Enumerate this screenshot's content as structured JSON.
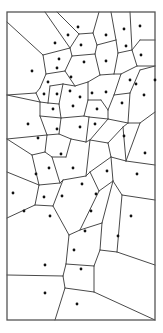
{
  "diagram": {
    "type": "voronoi",
    "width": 163,
    "height": 333,
    "colors": {
      "background": "#ffffff",
      "edge": "#4a4a4a",
      "border": "#555555",
      "site": "#111111"
    },
    "border": {
      "x1": 7,
      "y1": 12,
      "x2": 155,
      "y2": 320
    },
    "sites": [
      [
        78,
        27
      ],
      [
        68,
        35
      ],
      [
        55,
        43
      ],
      [
        81,
        45
      ],
      [
        106,
        35
      ],
      [
        124,
        29
      ],
      [
        140,
        26
      ],
      [
        126,
        46
      ],
      [
        141,
        55
      ],
      [
        59,
        59
      ],
      [
        84,
        62
      ],
      [
        106,
        61
      ],
      [
        32,
        71
      ],
      [
        57,
        68
      ],
      [
        71,
        77
      ],
      [
        48,
        82
      ],
      [
        130,
        80
      ],
      [
        155,
        80
      ],
      [
        44,
        94
      ],
      [
        57,
        94
      ],
      [
        70,
        91
      ],
      [
        80,
        97
      ],
      [
        92,
        93
      ],
      [
        106,
        92
      ],
      [
        136,
        84
      ],
      [
        53,
        109
      ],
      [
        73,
        106
      ],
      [
        97,
        109
      ],
      [
        122,
        103
      ],
      [
        144,
        95
      ],
      [
        28,
        124
      ],
      [
        38,
        138
      ],
      [
        57,
        129
      ],
      [
        80,
        127
      ],
      [
        95,
        124
      ],
      [
        124,
        136
      ],
      [
        145,
        153
      ],
      [
        61,
        154
      ],
      [
        107,
        171
      ],
      [
        137,
        174
      ],
      [
        36,
        174
      ],
      [
        49,
        168
      ],
      [
        73,
        168
      ],
      [
        13,
        193
      ],
      [
        44,
        197
      ],
      [
        62,
        196
      ],
      [
        82,
        184
      ],
      [
        96,
        194
      ],
      [
        24,
        211
      ],
      [
        50,
        216
      ],
      [
        91,
        211
      ],
      [
        131,
        216
      ],
      [
        85,
        231
      ],
      [
        118,
        236
      ],
      [
        74,
        250
      ],
      [
        45,
        265
      ],
      [
        81,
        269
      ],
      [
        45,
        293
      ],
      [
        77,
        304
      ]
    ],
    "edges": [
      [
        7,
        22,
        43,
        55
      ],
      [
        45,
        12,
        70,
        48
      ],
      [
        57,
        12,
        79,
        34
      ],
      [
        43,
        55,
        70,
        48
      ],
      [
        70,
        48,
        79,
        34
      ],
      [
        79,
        34,
        93,
        33
      ],
      [
        93,
        33,
        99,
        12
      ],
      [
        93,
        33,
        97,
        45
      ],
      [
        97,
        45,
        116,
        40
      ],
      [
        116,
        40,
        111,
        12
      ],
      [
        116,
        40,
        118,
        53
      ],
      [
        118,
        53,
        132,
        50
      ],
      [
        132,
        50,
        130,
        12
      ],
      [
        132,
        50,
        140,
        40
      ],
      [
        140,
        40,
        155,
        40
      ],
      [
        70,
        48,
        72,
        56
      ],
      [
        72,
        56,
        95,
        54
      ],
      [
        95,
        54,
        97,
        45
      ],
      [
        95,
        54,
        100,
        75
      ],
      [
        118,
        53,
        114,
        74
      ],
      [
        114,
        74,
        100,
        75
      ],
      [
        43,
        55,
        46,
        74
      ],
      [
        46,
        74,
        65,
        71
      ],
      [
        65,
        71,
        72,
        56
      ],
      [
        132,
        50,
        137,
        66
      ],
      [
        137,
        66,
        155,
        66
      ],
      [
        137,
        66,
        121,
        74
      ],
      [
        121,
        74,
        114,
        74
      ],
      [
        65,
        71,
        75,
        86
      ],
      [
        75,
        86,
        88,
        82
      ],
      [
        88,
        82,
        100,
        75
      ],
      [
        46,
        74,
        40,
        88
      ],
      [
        40,
        88,
        36,
        93
      ],
      [
        7,
        95,
        36,
        93
      ],
      [
        7,
        95,
        40,
        102
      ],
      [
        36,
        93,
        40,
        102
      ],
      [
        40,
        102,
        48,
        103
      ],
      [
        48,
        103,
        50,
        86
      ],
      [
        50,
        86,
        63,
        84
      ],
      [
        63,
        84,
        75,
        86
      ],
      [
        48,
        103,
        59,
        104
      ],
      [
        59,
        104,
        63,
        84
      ],
      [
        59,
        104,
        61,
        118
      ],
      [
        40,
        102,
        40,
        116
      ],
      [
        40,
        116,
        61,
        118
      ],
      [
        61,
        118,
        84,
        116
      ],
      [
        84,
        116,
        88,
        100
      ],
      [
        88,
        100,
        88,
        82
      ],
      [
        88,
        100,
        101,
        100
      ],
      [
        101,
        100,
        108,
        110
      ],
      [
        108,
        110,
        114,
        95
      ],
      [
        114,
        95,
        121,
        74
      ],
      [
        114,
        95,
        130,
        93
      ],
      [
        130,
        93,
        140,
        70
      ],
      [
        140,
        70,
        155,
        66
      ],
      [
        130,
        93,
        128,
        123
      ],
      [
        128,
        123,
        108,
        119
      ],
      [
        108,
        119,
        108,
        110
      ],
      [
        128,
        123,
        140,
        123
      ],
      [
        140,
        123,
        155,
        112
      ],
      [
        84,
        116,
        89,
        117
      ],
      [
        89,
        117,
        108,
        119
      ],
      [
        108,
        119,
        90,
        140
      ],
      [
        89,
        117,
        86,
        142
      ],
      [
        86,
        142,
        90,
        140
      ],
      [
        61,
        118,
        59,
        134
      ],
      [
        40,
        116,
        47,
        135
      ],
      [
        47,
        135,
        59,
        134
      ],
      [
        7,
        139,
        47,
        135
      ],
      [
        47,
        135,
        45,
        152
      ],
      [
        45,
        152,
        52,
        157
      ],
      [
        52,
        157,
        66,
        157
      ],
      [
        66,
        157,
        71,
        139
      ],
      [
        71,
        139,
        86,
        142
      ],
      [
        59,
        134,
        71,
        139
      ],
      [
        7,
        139,
        32,
        155
      ],
      [
        32,
        155,
        45,
        152
      ],
      [
        32,
        155,
        39,
        185
      ],
      [
        39,
        185,
        60,
        183
      ],
      [
        60,
        183,
        52,
        157
      ],
      [
        60,
        183,
        63,
        180
      ],
      [
        63,
        180,
        86,
        176
      ],
      [
        86,
        176,
        90,
        140
      ],
      [
        90,
        140,
        108,
        143
      ],
      [
        108,
        143,
        123,
        127
      ],
      [
        123,
        127,
        128,
        123
      ],
      [
        108,
        143,
        111,
        157
      ],
      [
        111,
        157,
        126,
        161
      ],
      [
        126,
        161,
        123,
        127
      ],
      [
        126,
        161,
        140,
        123
      ],
      [
        126,
        161,
        155,
        165
      ],
      [
        111,
        157,
        90,
        172
      ],
      [
        90,
        172,
        86,
        176
      ],
      [
        90,
        172,
        99,
        191
      ],
      [
        99,
        191,
        113,
        181
      ],
      [
        113,
        181,
        111,
        157
      ],
      [
        113,
        181,
        122,
        195
      ],
      [
        122,
        195,
        155,
        200
      ],
      [
        7,
        172,
        39,
        185
      ],
      [
        39,
        185,
        35,
        205
      ],
      [
        35,
        205,
        7,
        218
      ],
      [
        35,
        205,
        53,
        206
      ],
      [
        53,
        206,
        63,
        180
      ],
      [
        53,
        206,
        69,
        235
      ],
      [
        69,
        235,
        80,
        230
      ],
      [
        80,
        230,
        99,
        191
      ],
      [
        80,
        230,
        102,
        223
      ],
      [
        102,
        223,
        113,
        181
      ],
      [
        102,
        223,
        100,
        250
      ],
      [
        100,
        250,
        117,
        252
      ],
      [
        117,
        252,
        122,
        195
      ],
      [
        117,
        252,
        155,
        265
      ],
      [
        100,
        250,
        94,
        266
      ],
      [
        94,
        266,
        66,
        264
      ],
      [
        66,
        264,
        69,
        235
      ],
      [
        66,
        264,
        63,
        276
      ],
      [
        63,
        276,
        7,
        275
      ],
      [
        63,
        276,
        65,
        288
      ],
      [
        65,
        288,
        94,
        292
      ],
      [
        94,
        292,
        94,
        266
      ],
      [
        94,
        292,
        155,
        320
      ],
      [
        65,
        288,
        55,
        320
      ]
    ]
  }
}
